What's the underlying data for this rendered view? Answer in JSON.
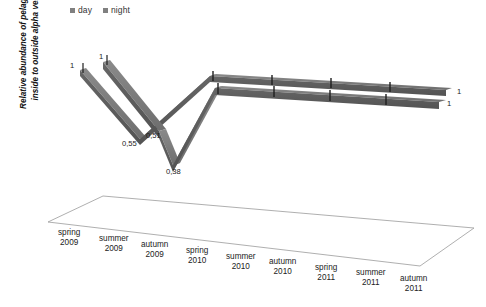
{
  "chart_data": {
    "type": "line",
    "title": "",
    "xlabel": "",
    "ylabel": "Relative abundance of pelagic fish inside to outside alpha ventus",
    "categories": [
      "spring 2009",
      "summer 2009",
      "autumn 2009",
      "spring 2010",
      "summer 2010",
      "autumn 2010",
      "spring 2011",
      "summer 2011",
      "autumn 2011"
    ],
    "series": [
      {
        "name": "day",
        "color": "#6b6b6b",
        "values": [
          1,
          null,
          0.51,
          1,
          1,
          1,
          1,
          1,
          1
        ],
        "point_labels": [
          "1",
          "",
          "0,51",
          "",
          "",
          "",
          "",
          "",
          "1"
        ]
      },
      {
        "name": "night",
        "color": "#6e6e6e",
        "values": [
          1,
          null,
          0.55,
          0.38,
          1,
          1,
          1,
          1,
          1
        ],
        "point_labels": [
          "1",
          "",
          "0,55",
          "0,38",
          "",
          "",
          "",
          "",
          "1"
        ]
      }
    ],
    "legend": [
      "day",
      "night"
    ],
    "legend_position": "top-left",
    "grid": false,
    "projection": "3d-ribbon",
    "ylim": [
      0,
      1.1
    ]
  },
  "ylabel_lines": [
    "Relative abundance of pelagic fish",
    "inside to outside alpha ventus"
  ],
  "legend": {
    "items": [
      {
        "label": "day",
        "color": "#808080"
      },
      {
        "label": "night",
        "color": "#808080"
      }
    ]
  },
  "data_labels": [
    {
      "text": "1",
      "x": 70,
      "y": 62,
      "name": "data-label-day-spring-2009"
    },
    {
      "text": "1",
      "x": 99,
      "y": 53,
      "name": "data-label-night-spring-2009"
    },
    {
      "text": "0,55",
      "x": 122,
      "y": 140,
      "name": "data-label-day-autumn-2009"
    },
    {
      "text": "0,51",
      "x": 146,
      "y": 132,
      "name": "data-label-night-autumn-2009"
    },
    {
      "text": "0,38",
      "x": 166,
      "y": 168,
      "name": "data-label-spring-2010-min"
    },
    {
      "text": "1",
      "x": 457,
      "y": 88,
      "name": "data-label-day-autumn-2011"
    },
    {
      "text": "1",
      "x": 447,
      "y": 100,
      "name": "data-label-night-autumn-2011"
    }
  ],
  "x_axis_labels": [
    {
      "line1": "spring",
      "line2": "2009",
      "x": 58,
      "y": 228
    },
    {
      "line1": "summer",
      "line2": "2009",
      "x": 99,
      "y": 234
    },
    {
      "line1": "autumn",
      "line2": "2009",
      "x": 141,
      "y": 240
    },
    {
      "line1": "spring",
      "line2": "2010",
      "x": 186,
      "y": 246
    },
    {
      "line1": "summer",
      "line2": "2010",
      "x": 226,
      "y": 252
    },
    {
      "line1": "autumn",
      "line2": "2010",
      "x": 269,
      "y": 257
    },
    {
      "line1": "spring",
      "line2": "2011",
      "x": 315,
      "y": 263
    },
    {
      "line1": "summer",
      "line2": "2011",
      "x": 356,
      "y": 268
    },
    {
      "line1": "autumn",
      "line2": "2011",
      "x": 400,
      "y": 274
    }
  ]
}
